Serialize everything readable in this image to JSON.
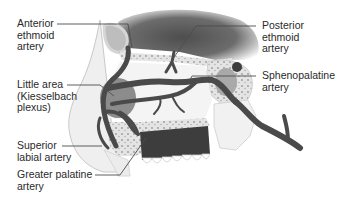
{
  "diagram": {
    "colors": {
      "artery": "#4a4a4a",
      "bone_fill": "#e9e9e9",
      "cranial_cavity": "#6a6a6a",
      "little_area": "#8c8c8c",
      "palate_dark": "#3d3d3d",
      "leader_line": "#4d4d4d",
      "text": "#2a2a2a"
    },
    "labels": {
      "anterior_ethmoid": [
        "Anterior",
        "ethmoid",
        "artery"
      ],
      "little_area": [
        "Little area",
        "(Kiesselbach",
        "plexus)"
      ],
      "superior_labial": [
        "Superior",
        "labial artery"
      ],
      "greater_palatine": [
        "Greater palatine",
        "artery"
      ],
      "posterior_ethmoid": [
        "Posterior",
        "ethmoid",
        "artery"
      ],
      "sphenopalatine": [
        "Sphenopalatine",
        "artery"
      ]
    }
  }
}
